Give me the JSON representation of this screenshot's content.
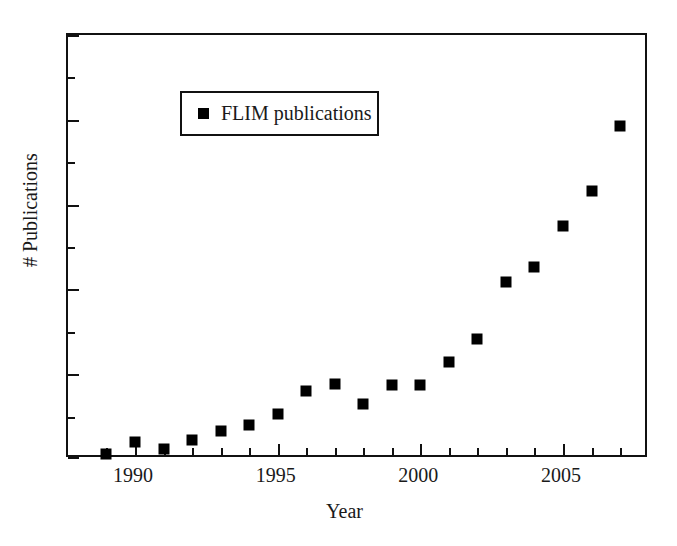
{
  "chart_data": {
    "type": "scatter",
    "title": "",
    "xlabel": "Year",
    "ylabel": "# Publications",
    "xlim": [
      1988.6,
      1608.9
    ],
    "x_tick_labels": [
      "1990",
      "1995",
      "2000",
      "2005"
    ],
    "x_major_ticks": [
      1990,
      1995,
      2000,
      2005
    ],
    "x_minor_ticks": [
      1989,
      1991,
      1992,
      1993,
      1994,
      1996,
      1997,
      1998,
      1999,
      2001,
      2002,
      2003,
      2004,
      2006,
      2007
    ],
    "y_tick_labels": [],
    "y_axis_labeled": false,
    "y_tick_count": 11,
    "grid": false,
    "legend_position": "top-left",
    "marker": "filled-square",
    "marker_color": "#000000",
    "series": [
      {
        "name": "FLIM publications",
        "x": [
          1989,
          1990,
          1991,
          1992,
          1993,
          1994,
          1995,
          1996,
          1997,
          1998,
          1999,
          2000,
          2001,
          2002,
          2003,
          2004,
          2005,
          2006,
          2007
        ],
        "values": [
          3,
          13,
          8,
          16,
          25,
          30,
          40,
          62,
          68,
          50,
          66,
          66,
          92,
          114,
          160,
          180,
          215,
          270,
          335
        ],
        "y_pixels": [
          452,
          440,
          447,
          438,
          429,
          423,
          412,
          389,
          382,
          402,
          383,
          383,
          360,
          337,
          280,
          265,
          224,
          189,
          124
        ]
      }
    ]
  },
  "legend": {
    "entries": [
      {
        "label": "FLIM publications",
        "marker": "filled-square",
        "color": "#000000"
      }
    ]
  },
  "axes": {
    "x_title": "Year",
    "y_title": "# Publications"
  },
  "style": {
    "frame_color": "#111111",
    "background": "#ffffff",
    "text_color": "#1a1a1a"
  }
}
